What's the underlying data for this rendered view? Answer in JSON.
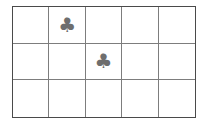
{
  "worksheet": {
    "title": "Club symbol counting grid",
    "background_color": "#ffffff",
    "grid": {
      "columns": 5,
      "rows": 3,
      "outer_border_color": "#4a4a4a",
      "inner_line_color": "#7d7d7d",
      "cell_background": "#ffffff",
      "symbol_color": "#6e6e6e",
      "symbol_name": "club-icon",
      "symbol_glyph": "♣",
      "total_symbols": 2,
      "cells": [
        [
          {
            "symbol": "",
            "filled": false
          },
          {
            "symbol": "♣",
            "filled": true
          },
          {
            "symbol": "",
            "filled": false
          },
          {
            "symbol": "",
            "filled": false
          },
          {
            "symbol": "",
            "filled": false
          }
        ],
        [
          {
            "symbol": "",
            "filled": false
          },
          {
            "symbol": "",
            "filled": false
          },
          {
            "symbol": "♣",
            "filled": true
          },
          {
            "symbol": "",
            "filled": false
          },
          {
            "symbol": "",
            "filled": false
          }
        ],
        [
          {
            "symbol": "",
            "filled": false
          },
          {
            "symbol": "",
            "filled": false
          },
          {
            "symbol": "",
            "filled": false
          },
          {
            "symbol": "",
            "filled": false
          },
          {
            "symbol": "",
            "filled": false
          }
        ]
      ]
    }
  }
}
